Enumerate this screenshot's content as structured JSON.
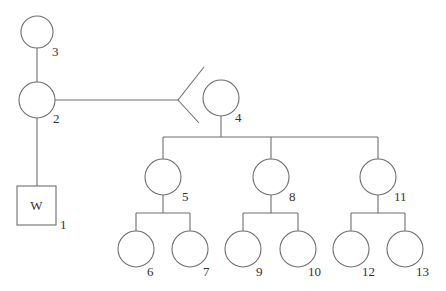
{
  "diagram": {
    "type": "family-tree",
    "colors": {
      "line": "#6e6e6e",
      "text": "#333333",
      "background": "#ffffff"
    },
    "nodes": [
      {
        "id": "1",
        "shape": "square",
        "inner_label": "W",
        "label": "1"
      },
      {
        "id": "2",
        "shape": "circle",
        "label": "2"
      },
      {
        "id": "3",
        "shape": "circle",
        "label": "3"
      },
      {
        "id": "4",
        "shape": "circle",
        "label": "4"
      },
      {
        "id": "5",
        "shape": "circle",
        "label": "5"
      },
      {
        "id": "6",
        "shape": "circle",
        "label": "6"
      },
      {
        "id": "7",
        "shape": "circle",
        "label": "7"
      },
      {
        "id": "8",
        "shape": "circle",
        "label": "8"
      },
      {
        "id": "9",
        "shape": "circle",
        "label": "9"
      },
      {
        "id": "10",
        "shape": "circle",
        "label": "10"
      },
      {
        "id": "11",
        "shape": "circle",
        "label": "11"
      },
      {
        "id": "12",
        "shape": "circle",
        "label": "12"
      },
      {
        "id": "13",
        "shape": "circle",
        "label": "13"
      }
    ],
    "edges": [
      {
        "from": "3",
        "to": "2",
        "type": "line"
      },
      {
        "from": "2",
        "to": "1",
        "type": "line"
      },
      {
        "from": "2",
        "to": "4",
        "type": "branching-fork"
      },
      {
        "from": "4",
        "to": [
          "5",
          "8",
          "11"
        ],
        "type": "children"
      },
      {
        "from": "5",
        "to": [
          "6",
          "7"
        ],
        "type": "children"
      },
      {
        "from": "8",
        "to": [
          "9",
          "10"
        ],
        "type": "children"
      },
      {
        "from": "11",
        "to": [
          "12",
          "13"
        ],
        "type": "children"
      }
    ]
  }
}
